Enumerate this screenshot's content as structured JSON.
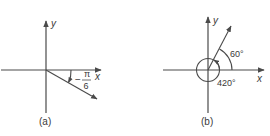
{
  "panels": [
    {
      "id": "a",
      "caption": "(a)",
      "x_label": "x",
      "y_label": "y",
      "angle_sign": "−",
      "angle_numerator": "π",
      "angle_denominator": "6",
      "angle_value_text": "−π/6"
    },
    {
      "id": "b",
      "caption": "(b)",
      "x_label": "x",
      "y_label": "y",
      "angle_small": "60°",
      "angle_large": "420°"
    }
  ],
  "colors": {
    "line": "#4a4a4a",
    "text": "#3a3a3a"
  }
}
